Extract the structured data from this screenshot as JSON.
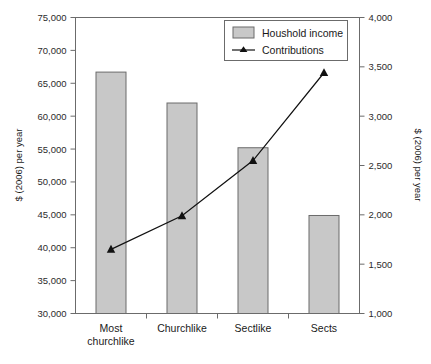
{
  "chart_data": {
    "type": "bar",
    "title": "",
    "subtitle": "",
    "categories": [
      "Most churchlike",
      "Churchlike",
      "Sectlike",
      "Sects"
    ],
    "category_lines": [
      [
        "Most",
        "churchlike"
      ],
      [
        "Churchlike"
      ],
      [
        "Sectlike"
      ],
      [
        "Sects"
      ]
    ],
    "series": [
      {
        "name": "Houshold income",
        "type": "bar",
        "axis": "left",
        "values": [
          66700,
          62000,
          55200,
          44900
        ],
        "color": "#c8c8c8",
        "border_color": "#6b6b6b"
      },
      {
        "name": "Contributions",
        "type": "line",
        "axis": "right",
        "values": [
          1650,
          1990,
          2550,
          3440
        ],
        "color": "#111111",
        "marker": "triangle"
      }
    ],
    "xlabel": "",
    "ylabel": "$ (2006) per year",
    "y2label": "$ (2006) per year",
    "ylim": [
      30000,
      75000
    ],
    "y2lim": [
      1000,
      4000
    ],
    "yticks": [
      "30,000",
      "35,000",
      "40,000",
      "45,000",
      "50,000",
      "55,000",
      "60,000",
      "65,000",
      "70,000",
      "75,000"
    ],
    "ytick_values": [
      30000,
      35000,
      40000,
      45000,
      50000,
      55000,
      60000,
      65000,
      70000,
      75000
    ],
    "y2ticks": [
      "1,000",
      "1,500",
      "2,000",
      "2,500",
      "3,000",
      "3,500",
      "4,000"
    ],
    "y2tick_values": [
      1000,
      1500,
      2000,
      2500,
      3000,
      3500,
      4000
    ],
    "grid": false,
    "legend_position": "top-right",
    "legend": [
      {
        "label": "Houshold income",
        "marker": "swatch"
      },
      {
        "label": "Contributions",
        "marker": "line-triangle"
      }
    ]
  },
  "colors": {
    "bar_fill": "#c8c8c8",
    "bar_border": "#6b6b6b",
    "line": "#111111",
    "axis": "#6b6b6b",
    "text": "#1a1a1a",
    "background": "#ffffff"
  }
}
